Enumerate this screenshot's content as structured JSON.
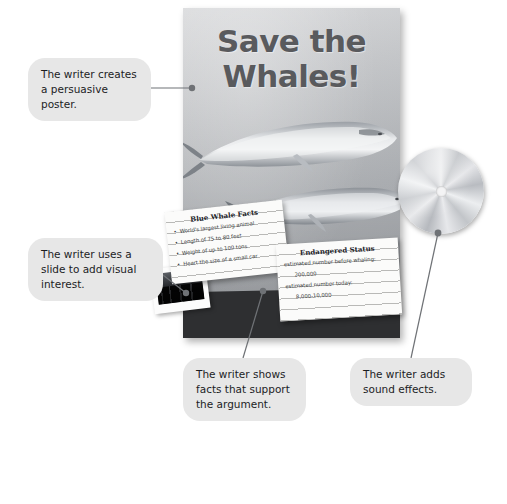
{
  "page": {
    "background_color": "#ffffff",
    "accent_callout_color": "#e7e7e7",
    "poster_text_color": "#595a5d"
  },
  "poster": {
    "name": "save-the-whales-poster",
    "title_line1": "Save the",
    "title_line2": "Whales!",
    "illustration": "two-blue-whales",
    "background_color": "#c3c5c8"
  },
  "disc": {
    "name": "audio-cd",
    "label": "",
    "color": "#d3d5d8"
  },
  "slide": {
    "name": "photo-slide",
    "caption": ""
  },
  "cards": [
    {
      "id": "blue-whale-facts",
      "title": "Blue Whale Facts",
      "items": [
        "World's largest living animal",
        "Length of 75 to 80 feet",
        "Weight of up to 100 tons",
        "Heart the size of a small car"
      ]
    },
    {
      "id": "endangered-status",
      "title": "Endangered Status",
      "items": [
        "estimated number before whaling:",
        "200,000",
        "estimated number today:",
        "8,000-10,000"
      ]
    }
  ],
  "callouts": [
    {
      "id": "callout-poster",
      "text": "The writer creates a persuasive poster."
    },
    {
      "id": "callout-slide",
      "text": "The writer uses a slide to add visual interest."
    },
    {
      "id": "callout-facts",
      "text": "The writer shows facts that support the argument."
    },
    {
      "id": "callout-sound",
      "text": "The writer adds sound effects."
    }
  ]
}
